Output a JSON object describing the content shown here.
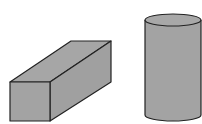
{
  "figure": {
    "shapes": [
      {
        "name": "rectangular prism",
        "fill": "#a3a3a3",
        "top_fill": "#a6a6a6",
        "side_fill": "#a0a0a0",
        "stroke": "#222222"
      },
      {
        "name": "cylinder",
        "fill": "#a3a3a3",
        "top_fill": "#a8a8a8",
        "stroke": "#222222"
      }
    ]
  }
}
